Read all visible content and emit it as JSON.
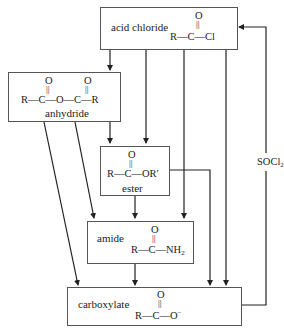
{
  "diagram": {
    "type": "reaction-relationship-flowchart",
    "nodes": {
      "acid_chloride": {
        "label": "acid chloride",
        "formula_top": "O",
        "formula_bond": "||",
        "formula_main": "R—C—Cl"
      },
      "anhydride": {
        "label": "anhydride",
        "formula_top_1": "O",
        "formula_top_2": "O",
        "formula_bond_1": "||",
        "formula_bond_2": "||",
        "formula_main": "R—C—O—C—R"
      },
      "ester": {
        "label": "ester",
        "formula_top": "O",
        "formula_bond": "||",
        "formula_main": "R—C—OR′"
      },
      "amide": {
        "label": "amide",
        "formula_top": "O",
        "formula_bond": "||",
        "formula_main_prefix": "R—C—NH",
        "formula_main_sub": "2"
      },
      "carboxylate": {
        "label": "carboxylate",
        "formula_top": "O",
        "formula_bond": "||",
        "formula_main_prefix": "R—C—O",
        "formula_main_sup": "−"
      }
    },
    "reagent_label": {
      "prefix": "SOCl",
      "sub": "2"
    },
    "edges": [
      {
        "from": "acid chloride",
        "to": "anhydride"
      },
      {
        "from": "acid chloride",
        "to": "ester"
      },
      {
        "from": "acid chloride",
        "to": "amide"
      },
      {
        "from": "acid chloride",
        "to": "carboxylate"
      },
      {
        "from": "anhydride",
        "to": "ester"
      },
      {
        "from": "anhydride",
        "to": "amide"
      },
      {
        "from": "anhydride",
        "to": "carboxylate"
      },
      {
        "from": "ester",
        "to": "amide"
      },
      {
        "from": "ester",
        "to": "carboxylate"
      },
      {
        "from": "amide",
        "to": "carboxylate"
      },
      {
        "from": "carboxylate",
        "to": "acid chloride",
        "label": "SOCl2"
      }
    ],
    "colors": {
      "line": "#222222",
      "box_border": "#555555",
      "background": "#ffffff"
    }
  }
}
